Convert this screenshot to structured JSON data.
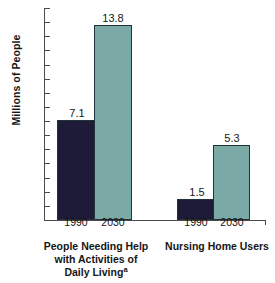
{
  "chart_data": {
    "type": "bar",
    "title": "",
    "xlabel": "",
    "ylabel": "Millions of People",
    "ylim": [
      0,
      15
    ],
    "ytick_labels": [
      "15",
      "14",
      "13",
      "12",
      "11",
      "10",
      "9",
      "8",
      "7",
      "6",
      "5",
      "4",
      "3",
      "2",
      "1",
      "0"
    ],
    "grid": false,
    "legend": "none",
    "categories": [
      "People Needing Help with Activities of Daily Living",
      "Nursing Home Users"
    ],
    "series": [
      {
        "name": "1990",
        "values": [
          7.1,
          1.5
        ],
        "color": "#1d1b38"
      },
      {
        "name": "2030",
        "values": [
          13.8,
          5.3
        ],
        "color": "#7aa9a6"
      }
    ],
    "groups": [
      {
        "caption_lines": [
          "People Needing Help",
          "with Activities of",
          "Daily Living"
        ],
        "caption_superscript": "a",
        "bars": [
          {
            "year": "1990",
            "value": 7.1,
            "value_label": "7.1",
            "color": "#1d1b38"
          },
          {
            "year": "2030",
            "value": 13.8,
            "value_label": "13.8",
            "color": "#7aa9a6"
          }
        ]
      },
      {
        "caption_lines": [
          "Nursing Home Users"
        ],
        "caption_superscript": "",
        "bars": [
          {
            "year": "1990",
            "value": 1.5,
            "value_label": "1.5",
            "color": "#1d1b38"
          },
          {
            "year": "2030",
            "value": 5.3,
            "value_label": "5.3",
            "color": "#7aa9a6"
          }
        ]
      }
    ],
    "colors": {
      "bar_1990": "#1d1b38",
      "bar_2030": "#7aa9a6",
      "axis": "#4a4a4a",
      "text": "#151515",
      "background": "#ffffff"
    }
  }
}
